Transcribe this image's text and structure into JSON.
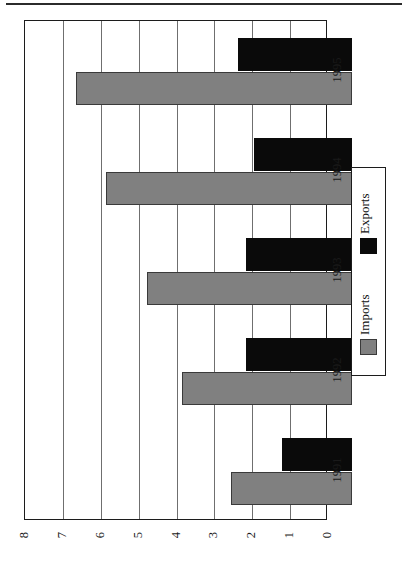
{
  "chart_data": {
    "type": "bar",
    "orientation": "horizontal-rotated",
    "title": "",
    "xlabel": "",
    "ylabel": "",
    "categories": [
      "1991",
      "1992",
      "1993",
      "1994",
      "1995"
    ],
    "series": [
      {
        "name": "Imports",
        "color": "#808080",
        "values": [
          3.2,
          4.5,
          5.4,
          6.5,
          7.3
        ]
      },
      {
        "name": "Exports",
        "color": "#0a0a0a",
        "values": [
          1.85,
          2.8,
          2.8,
          2.6,
          3.0
        ]
      }
    ],
    "value_axis": {
      "min": 0,
      "max": 8,
      "tick_step": 1,
      "ticks": [
        "8",
        "7",
        "6",
        "5",
        "4",
        "3",
        "2",
        "1",
        "0"
      ],
      "direction": "descending-left-to-right"
    },
    "grid": true,
    "legend_position": "right"
  },
  "legend": {
    "entries": [
      {
        "label": "Imports",
        "swatch": "gray-swatch"
      },
      {
        "label": "Exports",
        "swatch": "black-swatch"
      }
    ]
  },
  "axis": {
    "tick_labels": [
      "8",
      "7",
      "6",
      "5",
      "4",
      "3",
      "2",
      "1",
      "0"
    ],
    "category_labels": [
      "1995",
      "1994",
      "1993",
      "1992",
      "1991"
    ]
  },
  "colors": {
    "imports": "#808080",
    "exports": "#0a0a0a",
    "frame": "#1c1c1c",
    "grid": "#6f6f6f",
    "rule": "#2b2b2b"
  }
}
